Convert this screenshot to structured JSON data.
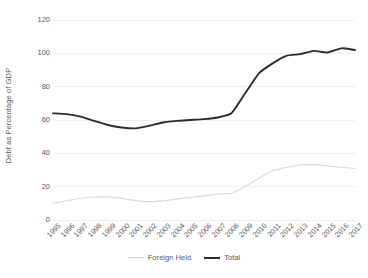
{
  "chart_data": {
    "type": "line",
    "title": "",
    "xlabel": "",
    "ylabel": "Debt as Percentage of GDP",
    "x": [
      1995,
      1996,
      1997,
      1998,
      1999,
      2000,
      2001,
      2002,
      2003,
      2004,
      2005,
      2006,
      2007,
      2008,
      2009,
      2010,
      2011,
      2012,
      2013,
      2014,
      2015,
      2016,
      2017
    ],
    "categories": [
      "1995",
      "1996",
      "1997",
      "1998",
      "1999",
      "2000",
      "2001",
      "2002",
      "2003",
      "2004",
      "2005",
      "2006",
      "2007",
      "2008",
      "2009",
      "2010",
      "2011",
      "2012",
      "2013",
      "2014",
      "2015",
      "2016",
      "2017"
    ],
    "series": [
      {
        "name": "Foreign Held",
        "color": "#d9d9d9",
        "values": [
          10,
          11.5,
          13,
          13.8,
          13.8,
          13,
          11.6,
          11,
          11.5,
          12.5,
          13.5,
          14.5,
          15.5,
          16,
          20,
          25,
          29.5,
          31.5,
          33,
          33.2,
          32.5,
          31.5,
          31
        ]
      },
      {
        "name": "Total",
        "color": "#2b2b2b",
        "values": [
          64,
          63.5,
          62,
          59.5,
          57,
          55.5,
          55,
          56.5,
          58.5,
          59.5,
          60,
          60.5,
          61.5,
          64,
          76,
          88,
          94,
          98.5,
          99.5,
          101.5,
          100.5,
          103,
          102
        ]
      }
    ],
    "ylim": [
      0,
      120
    ],
    "y_ticks": [
      0,
      20,
      40,
      60,
      80,
      100,
      120
    ],
    "xlim": [
      1995,
      2017
    ],
    "grid": "horizontal",
    "legend_position": "bottom",
    "legend": [
      "Foreign Held",
      "Total"
    ]
  },
  "axes": {
    "y_title": "Debt as Percentage of GDP",
    "y_tick_labels": [
      "120",
      "100",
      "80",
      "60",
      "40",
      "20",
      "0"
    ],
    "x_tick_labels": [
      "1995",
      "1996",
      "1997",
      "1998",
      "1999",
      "2000",
      "2001",
      "2002",
      "2003",
      "2004",
      "2005",
      "2006",
      "2007",
      "2008",
      "2009",
      "2010",
      "2011",
      "2012",
      "2013",
      "2014",
      "2015",
      "2016",
      "2017"
    ]
  },
  "legend": {
    "items": [
      {
        "label": "Foreign Held",
        "color": "#d9d9d9"
      },
      {
        "label": "Total",
        "color": "#2b2b2b"
      }
    ]
  },
  "colors": {
    "background": "#ffffff",
    "gridline": "#eeeeee",
    "text": "#595959",
    "foreign_held": "#d9d9d9",
    "total": "#2b2b2b"
  }
}
